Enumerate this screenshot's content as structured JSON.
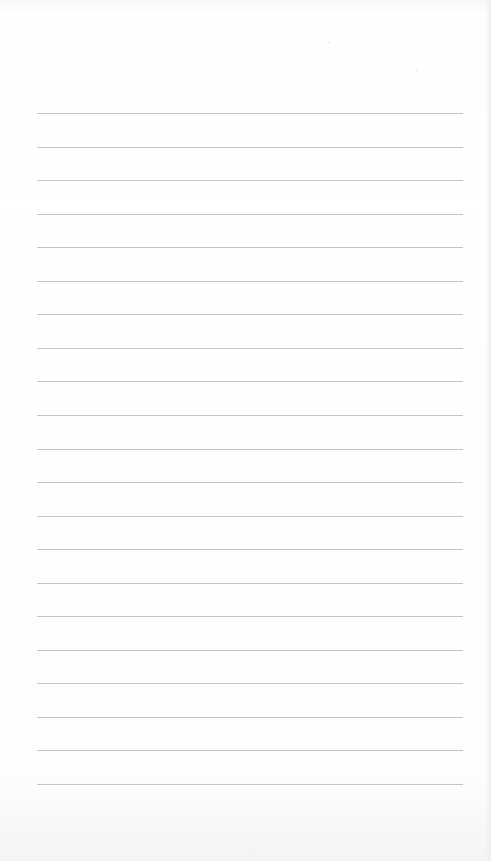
{
  "page": {
    "type": "lined-paper",
    "background_color": "#ffffff",
    "rule_color": "#c4c4c4",
    "rule_count": 21,
    "rule_left_px": 37,
    "rule_right_px": 463,
    "first_rule_y_px": 113,
    "rule_spacing_px": 33.55
  }
}
